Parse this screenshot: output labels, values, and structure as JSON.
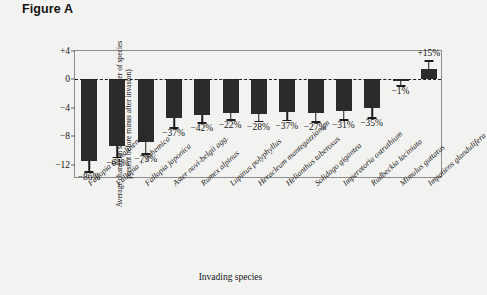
{
  "figure": {
    "title": "Figure A"
  },
  "chart_data": {
    "type": "bar",
    "title": "Figure A",
    "xlabel": "Invading species",
    "ylabel": "Average change in species richness (number of species present before minus after invasion)",
    "ylim": [
      -14,
      4
    ],
    "yticks": [
      4,
      0,
      -4,
      -8,
      -12
    ],
    "ytick_labels": [
      "+4",
      "0",
      "−4",
      "−8",
      "−12"
    ],
    "grid": false,
    "legend": "none",
    "zero_reference_line": true,
    "categories": [
      "Fallopia sachalinensis",
      "Fallopia × bohemica",
      "Fallopia japonica",
      "Aster novi-belgii agg.",
      "Rumex alpinus",
      "Lupinus polyphyllus",
      "Heracleum mantegazzianum",
      "Helianthus tuberosus",
      "Solidago gigantea",
      "Imperatoria ostruthium",
      "Rudbeckia laciniata",
      "Mimulus guttatus",
      "Impatiens glandulifera"
    ],
    "values": [
      -11.4,
      -9.3,
      -8.8,
      -5.4,
      -5.0,
      -4.7,
      -4.8,
      -4.6,
      -4.7,
      -4.4,
      -4.0,
      -0.25,
      1.4
    ],
    "errors": [
      1.5,
      1.6,
      1.6,
      1.3,
      1.0,
      0.9,
      1.0,
      1.1,
      1.2,
      1.2,
      1.3,
      0.6,
      1.3
    ],
    "data_labels": [
      "−86%",
      "−64%",
      "−73%",
      "−37%",
      "−42%",
      "−22%",
      "−28%",
      "−37%",
      "−27%",
      "−31%",
      "−35%",
      "−1%",
      "+15%"
    ],
    "bar_color": "#2b2b2b",
    "axis_color": "#8d8d8d",
    "background_color": "#f2f2f0"
  }
}
